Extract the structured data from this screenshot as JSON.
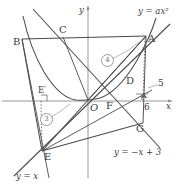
{
  "figure": {
    "axes": {
      "x_label": "x",
      "y_label": "y",
      "origin_label": "O"
    },
    "curve_labels": {
      "parabola": "y = ax²",
      "line_negative": "y = −x + 3",
      "line_identity": "y = x"
    },
    "points": [
      {
        "id": "A",
        "label": "A"
      },
      {
        "id": "B",
        "label": "B"
      },
      {
        "id": "C",
        "label": "C"
      },
      {
        "id": "D",
        "label": "D"
      },
      {
        "id": "E",
        "label": "E"
      },
      {
        "id": "Ep",
        "label": "E′"
      },
      {
        "id": "F",
        "label": "F"
      },
      {
        "id": "G",
        "label": "G"
      },
      {
        "id": "Ap",
        "label": "A′"
      }
    ],
    "measurements": [
      {
        "id": "m5",
        "label": "5"
      },
      {
        "id": "m6",
        "label": "6"
      }
    ],
    "region_markers": [
      {
        "id": "r3",
        "label": "3"
      },
      {
        "id": "r4",
        "label": "4"
      }
    ],
    "colors": {
      "stroke": "#4a4a4a",
      "light_stroke": "#9a9a9a",
      "text": "#3b3b3b",
      "background": "#ffffff"
    }
  }
}
